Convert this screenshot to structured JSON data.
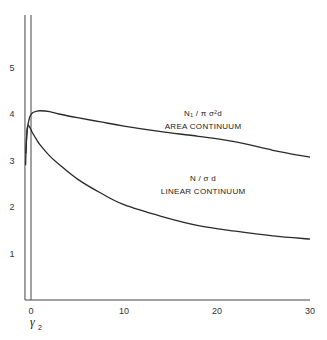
{
  "chart_data": {
    "type": "line",
    "title": "",
    "xlabel": "γ",
    "xlabel_subscript": "2",
    "ylabel": "",
    "xlim": [
      -0.65,
      30
    ],
    "ylim": [
      0,
      6
    ],
    "x_ticks": [
      0,
      10,
      20,
      30
    ],
    "x_tick_labels": [
      "0",
      "10",
      "20",
      "30"
    ],
    "y_ticks": [
      1,
      2,
      3,
      4,
      5
    ],
    "y_tick_labels": [
      "1",
      "2",
      "3",
      "4",
      "5"
    ],
    "grid": false,
    "legend": "none",
    "series": [
      {
        "name": "area-continuum",
        "label_formula": "N₁ / π σ²d",
        "label_name": "AREA CONTINUUM",
        "x": [
          -0.55,
          -0.45,
          -0.3,
          -0.1,
          0.2,
          0.6,
          1.0,
          2.0,
          3.0,
          5.0,
          7.5,
          10,
          14,
          18,
          22,
          26,
          30
        ],
        "y": [
          3.15,
          3.55,
          3.8,
          3.95,
          4.03,
          4.06,
          4.07,
          4.05,
          4.0,
          3.92,
          3.83,
          3.74,
          3.62,
          3.52,
          3.4,
          3.22,
          3.07
        ]
      },
      {
        "name": "linear-continuum",
        "label_formula": "N / σ d",
        "label_name": "LINEAR CONTINUUM",
        "x": [
          -0.58,
          -0.5,
          -0.4,
          -0.3,
          -0.1,
          0.2,
          0.6,
          1.0,
          2.0,
          3.0,
          5.0,
          7.5,
          10,
          14,
          18,
          22,
          26,
          30
        ],
        "y": [
          2.9,
          3.4,
          3.7,
          3.76,
          3.7,
          3.58,
          3.45,
          3.33,
          3.1,
          2.92,
          2.6,
          2.3,
          2.05,
          1.8,
          1.6,
          1.48,
          1.38,
          1.31
        ]
      }
    ],
    "annotations": [
      {
        "series": "area-continuum",
        "x": 18.5,
        "y": 3.95,
        "formula": "N₁ / π σ²d",
        "text": "AREA CONTINUUM"
      },
      {
        "series": "linear-continuum",
        "x": 18.5,
        "y": 2.55,
        "formula": "N / σ d",
        "text": "LINEAR CONTINUUM"
      }
    ]
  }
}
